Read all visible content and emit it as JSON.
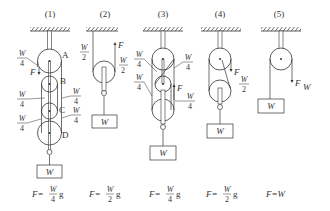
{
  "figure": {
    "panels": [
      {
        "id": "1",
        "title": "(1)",
        "pulley_labels": [
          "A",
          "B",
          "C",
          "D"
        ],
        "tension_labels": [
          {
            "num": "W",
            "den": "4"
          },
          {
            "num": "W",
            "den": "4"
          },
          {
            "num": "W",
            "den": "4"
          },
          {
            "num": "W",
            "den": "4"
          },
          {
            "num": "W",
            "den": "4"
          }
        ],
        "force_label": "F",
        "load_label": "W",
        "formula": {
          "lhs": "F=",
          "num": "W",
          "den": "4",
          "suffix": "g"
        }
      },
      {
        "id": "2",
        "title": "(2)",
        "tension_labels": [
          {
            "num": "W",
            "den": "2"
          },
          {
            "num": "W",
            "den": "2"
          }
        ],
        "force_label": "F",
        "load_label": "W",
        "formula": {
          "lhs": "F=",
          "num": "W",
          "den": "2",
          "suffix": "g"
        }
      },
      {
        "id": "3",
        "title": "(3)",
        "tension_labels": [
          {
            "num": "W",
            "den": "4"
          },
          {
            "num": "W",
            "den": "4"
          },
          {
            "num": "W",
            "den": "4"
          },
          {
            "num": "W",
            "den": "4"
          }
        ],
        "force_label": "F",
        "load_label": "W",
        "formula": {
          "lhs": "F=",
          "num": "W",
          "den": "4",
          "suffix": "g"
        }
      },
      {
        "id": "4",
        "title": "(4)",
        "tension_labels": [
          {
            "num": "W",
            "den": "2"
          }
        ],
        "force_label": "F",
        "load_label": "W",
        "formula": {
          "lhs": "F=",
          "num": "W",
          "den": "2",
          "suffix": "g"
        }
      },
      {
        "id": "5",
        "title": "(5)",
        "force_label": "F",
        "force_value_label": "W",
        "load_label": "W",
        "formula": {
          "text": "F=W"
        }
      }
    ]
  }
}
